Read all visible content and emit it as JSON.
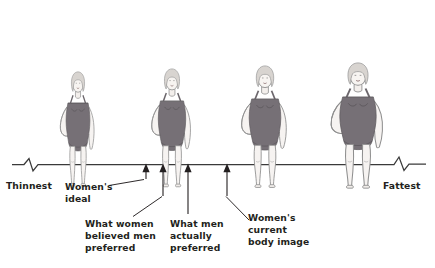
{
  "diagram": {
    "type": "body-image-continuum",
    "axis": {
      "left_label": "Thinnest",
      "right_label": "Fattest",
      "broken_ends": true,
      "y": 166,
      "x_start": 12,
      "x_end": 426
    },
    "figures": [
      {
        "name": "figure-1-thinnest",
        "x": 78,
        "scale": 0.93,
        "body_width": 0.8,
        "label": "thinnest body figure"
      },
      {
        "name": "figure-2",
        "x": 172,
        "scale": 0.96,
        "body_width": 0.92,
        "label": "slim body figure"
      },
      {
        "name": "figure-3",
        "x": 265,
        "scale": 0.99,
        "body_width": 1.06,
        "label": "fuller body figure"
      },
      {
        "name": "figure-4-fattest",
        "x": 358,
        "scale": 1.02,
        "body_width": 1.22,
        "label": "fattest body figure"
      }
    ],
    "markers": [
      {
        "name": "marker-womens-ideal",
        "x": 146,
        "label": "Women's ideal"
      },
      {
        "name": "marker-believed-men",
        "x": 163,
        "label": "What women believed men preferred"
      },
      {
        "name": "marker-men-actually",
        "x": 188,
        "label": "What men actually preferred"
      },
      {
        "name": "marker-current-body-image",
        "x": 227,
        "label": "Women's current body image"
      }
    ],
    "callouts": {
      "womens_ideal": {
        "line1": "Women's",
        "line2": "ideal"
      },
      "believed_men": {
        "line1": "What women",
        "line2": "believed men",
        "line3": "preferred"
      },
      "men_actually": {
        "line1": "What men",
        "line2": "actually",
        "line3": "preferred"
      },
      "current_image": {
        "line1": "Women's",
        "line2": "current",
        "line3": "body image"
      }
    },
    "colors": {
      "ink": "#231f20",
      "axis": "#3a3a3a",
      "swimsuit": "#767076",
      "skin": "#f3efec",
      "outline": "#8a8a8a",
      "hair": "#d8d4d0",
      "background": "#ffffff"
    }
  }
}
